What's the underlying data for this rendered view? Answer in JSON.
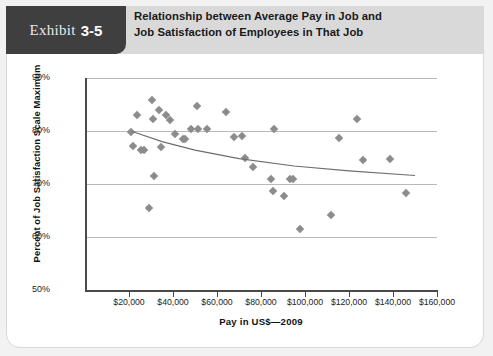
{
  "exhibit": {
    "word": "Exhibit",
    "number": "3-5"
  },
  "header": {
    "title_line1": "Relationship between Average Pay in Job and",
    "title_line2": "Job Satisfaction of Employees in That Job"
  },
  "chart_data": {
    "type": "scatter",
    "title": "Relationship between Average Pay in Job and Job Satisfaction of Employees in That Job",
    "xlabel": "Pay in US$—2009",
    "ylabel": "Percent of Job Satisfaction Scale Maximum",
    "xlim": [
      0,
      160000
    ],
    "ylim": [
      50,
      90
    ],
    "xticks": [
      20000,
      40000,
      60000,
      80000,
      100000,
      120000,
      140000,
      160000
    ],
    "xticklabels": [
      "$20,000",
      "$40,000",
      "$60,000",
      "$80,000",
      "$100,000",
      "$120,000",
      "$140,000",
      "$160,000"
    ],
    "yticks": [
      50,
      60,
      70,
      80,
      90
    ],
    "yticklabels": [
      "50%",
      "60%",
      "70%",
      "80%",
      "90%"
    ],
    "grid": "horizontal",
    "legend": "none",
    "marker": "diamond",
    "marker_color": "#8c8c8c",
    "points": [
      {
        "x": 21000,
        "y": 79.8
      },
      {
        "x": 22000,
        "y": 77.2
      },
      {
        "x": 23500,
        "y": 83.0
      },
      {
        "x": 25500,
        "y": 76.5
      },
      {
        "x": 27000,
        "y": 76.4
      },
      {
        "x": 30500,
        "y": 85.8
      },
      {
        "x": 31000,
        "y": 82.2
      },
      {
        "x": 33500,
        "y": 84.0
      },
      {
        "x": 34500,
        "y": 76.9
      },
      {
        "x": 37000,
        "y": 83.1
      },
      {
        "x": 31500,
        "y": 71.5
      },
      {
        "x": 29000,
        "y": 65.5
      },
      {
        "x": 38500,
        "y": 82.1
      },
      {
        "x": 41000,
        "y": 79.4
      },
      {
        "x": 44500,
        "y": 78.5
      },
      {
        "x": 45500,
        "y": 78.4
      },
      {
        "x": 48000,
        "y": 80.4
      },
      {
        "x": 51500,
        "y": 80.4
      },
      {
        "x": 55500,
        "y": 80.3
      },
      {
        "x": 51000,
        "y": 84.7
      },
      {
        "x": 64000,
        "y": 83.6
      },
      {
        "x": 67500,
        "y": 78.8
      },
      {
        "x": 71500,
        "y": 79.0
      },
      {
        "x": 72500,
        "y": 75.0
      },
      {
        "x": 76500,
        "y": 73.3
      },
      {
        "x": 86000,
        "y": 80.3
      },
      {
        "x": 84500,
        "y": 70.9
      },
      {
        "x": 93000,
        "y": 70.9
      },
      {
        "x": 94500,
        "y": 70.9
      },
      {
        "x": 85500,
        "y": 68.7
      },
      {
        "x": 90500,
        "y": 67.7
      },
      {
        "x": 97500,
        "y": 61.5
      },
      {
        "x": 112000,
        "y": 64.1
      },
      {
        "x": 123500,
        "y": 82.3
      },
      {
        "x": 115500,
        "y": 78.6
      },
      {
        "x": 126500,
        "y": 74.6
      },
      {
        "x": 138500,
        "y": 74.7
      },
      {
        "x": 146000,
        "y": 68.3
      }
    ],
    "trendline": {
      "description": "downward-sloping fitted curve",
      "points": [
        {
          "x": 21500,
          "y": 79.9
        },
        {
          "x": 35000,
          "y": 78.0
        },
        {
          "x": 50000,
          "y": 76.4
        },
        {
          "x": 70000,
          "y": 74.8
        },
        {
          "x": 95000,
          "y": 73.4
        },
        {
          "x": 120000,
          "y": 72.5
        },
        {
          "x": 150000,
          "y": 71.6
        }
      ]
    }
  }
}
